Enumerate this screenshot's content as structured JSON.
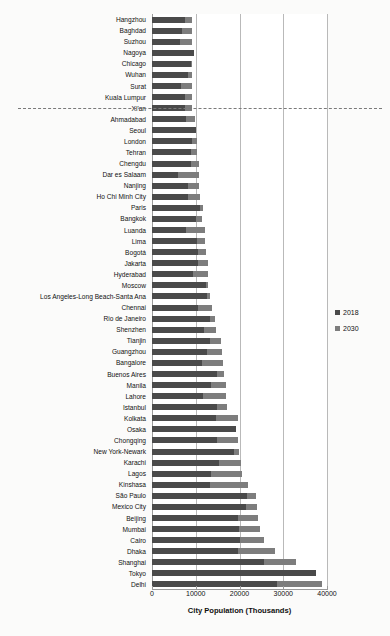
{
  "chart": {
    "type": "bar",
    "title": "",
    "xlabel": "City Population (Thousands)",
    "ylabel": "",
    "orientation": "horizontal",
    "grid": true,
    "legend_position": "right",
    "bar_colors": {
      "series_2018": "#4a4a4a",
      "series_2030": "#7d7d7d"
    },
    "separator_after_category": "Xi'an"
  },
  "legend": {
    "items": [
      {
        "label": "2018",
        "color": "#4a4a4a"
      },
      {
        "label": "2030",
        "color": "#7d7d7d"
      }
    ]
  },
  "axis": {
    "xlim": [
      0,
      40000
    ],
    "xticks": [
      0,
      10000,
      20000,
      30000,
      40000
    ],
    "xtick_labels": [
      "0",
      "10000",
      "20000",
      "30000",
      "40000"
    ],
    "title": "City Population (Thousands)"
  },
  "chart_data": {
    "type": "bar",
    "orientation": "horizontal",
    "title": "",
    "xlabel": "City Population (Thousands)",
    "ylabel": "",
    "xlim": [
      0,
      40000
    ],
    "xticks": [
      0,
      10000,
      20000,
      30000,
      40000
    ],
    "grid": true,
    "legend_position": "right",
    "categories": [
      "Hangzhou",
      "Baghdad",
      "Suzhou",
      "Nagoya",
      "Chicago",
      "Wuhan",
      "Surat",
      "Kuala Lumpur",
      "Xi'an",
      "Ahmadabad",
      "Seoul",
      "London",
      "Tehran",
      "Chengdu",
      "Dar es Salaam",
      "Nanjing",
      "Ho Chi Minh City",
      "Paris",
      "Bangkok",
      "Luanda",
      "Lima",
      "Bogotá",
      "Jakarta",
      "Hyderabad",
      "Moscow",
      "Los Angeles-Long Beach-Santa Ana",
      "Chennai",
      "Rio de Janeiro",
      "Shenzhen",
      "Tianjin",
      "Guangzhou",
      "Bangalore",
      "Buenos Aires",
      "Manila",
      "Lahore",
      "Istanbul",
      "Kolkata",
      "Osaka",
      "Chongqing",
      "New York-Newark",
      "Karachi",
      "Lagos",
      "Kinshasa",
      "São Paulo",
      "Mexico City",
      "Beijing",
      "Mumbai",
      "Cairo",
      "Dhaka",
      "Shanghai",
      "Tokyo",
      "Delhi"
    ],
    "series": [
      {
        "name": "2018",
        "color": "#4a4a4a",
        "values": [
          7642,
          6812,
          6339,
          9507,
          8864,
          8266,
          6564,
          7564,
          7444,
          7681,
          9963,
          9046,
          8896,
          8813,
          6048,
          8245,
          8145,
          10901,
          10156,
          7774,
          10391,
          10574,
          10517,
          9482,
          12410,
          12458,
          10456,
          13293,
          11908,
          13215,
          12638,
          11440,
          14967,
          13482,
          11738,
          14751,
          14681,
          19281,
          14838,
          18819,
          15400,
          13463,
          13171,
          21650,
          21581,
          19618,
          19980,
          20076,
          19578,
          25582,
          37468,
          28514
        ]
      },
      {
        "name": "2030",
        "color": "#7d7d7d",
        "values": [
          9223,
          9102,
          9091,
          9119,
          9113,
          9064,
          9112,
          9095,
          9110,
          9810,
          9975,
          10228,
          10240,
          10728,
          10789,
          10745,
          11054,
          11710,
          11508,
          12129,
          12221,
          12343,
          12687,
          12714,
          12796,
          13257,
          13814,
          14408,
          14537,
          15745,
          16024,
          16227,
          16456,
          16841,
          16883,
          17124,
          19563,
          18658,
          19649,
          19958,
          20432,
          20600,
          21914,
          23824,
          24111,
          24282,
          24572,
          25517,
          28076,
          32869,
          36574,
          38939
        ]
      }
    ]
  }
}
